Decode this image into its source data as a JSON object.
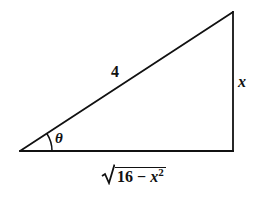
{
  "diagram": {
    "type": "right-triangle",
    "vertices": {
      "angle_vertex": [
        20,
        151
      ],
      "right_angle_vertex": [
        233,
        151
      ],
      "top_vertex": [
        233,
        12
      ]
    },
    "line_color": "#111111",
    "angle_arc_radius": 32
  },
  "labels": {
    "hypotenuse": "4",
    "opposite": "x",
    "angle": "θ",
    "adjacent": {
      "radicand_constant": "16",
      "operator": "−",
      "variable": "x",
      "exponent": "2"
    }
  }
}
